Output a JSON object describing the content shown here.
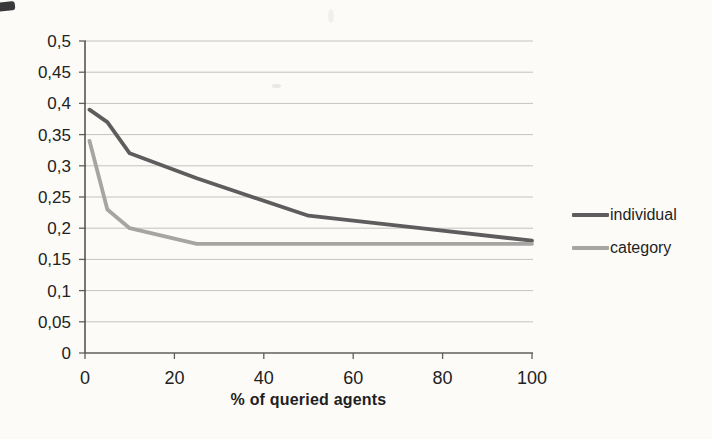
{
  "canvas": {
    "background": "#fcfbf8"
  },
  "chart_data": {
    "type": "line",
    "title": "",
    "xlabel": "% of queried agents",
    "ylabel": "",
    "xlim": [
      0,
      100
    ],
    "ylim": [
      0,
      0.5
    ],
    "x_ticks": [
      0,
      20,
      40,
      60,
      80,
      100
    ],
    "x_tick_labels": [
      "0",
      "20",
      "40",
      "60",
      "80",
      "100"
    ],
    "y_ticks": [
      0,
      0.05,
      0.1,
      0.15,
      0.2,
      0.25,
      0.3,
      0.35,
      0.4,
      0.45,
      0.5
    ],
    "y_tick_labels": [
      "0",
      "0,05",
      "0,1",
      "0,15",
      "0,2",
      "0,25",
      "0,3",
      "0,35",
      "0,4",
      "0,45",
      "0,5"
    ],
    "decimal_separator": ",",
    "grid": "horizontal",
    "legend_position": "right",
    "colors": {
      "axis": "#5f5f5f",
      "gridline": "#c4c3c0",
      "text": "#222222"
    },
    "series": [
      {
        "name": "individual",
        "color": "#5d5d5d",
        "x": [
          1,
          5,
          10,
          25,
          50,
          75,
          100
        ],
        "values": [
          0.39,
          0.37,
          0.32,
          0.28,
          0.22,
          0.2,
          0.18
        ]
      },
      {
        "name": "category",
        "color": "#a5a5a3",
        "x": [
          1,
          5,
          10,
          25,
          50,
          75,
          100
        ],
        "values": [
          0.34,
          0.23,
          0.2,
          0.175,
          0.175,
          0.175,
          0.175
        ]
      }
    ]
  }
}
